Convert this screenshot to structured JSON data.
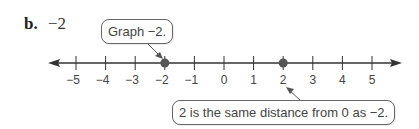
{
  "problem": {
    "label": "b.",
    "expression": "−2"
  },
  "callouts": {
    "top": "Graph −2.",
    "bottom": "2 is the same distance from 0 as −2."
  },
  "number_line": {
    "min": -5,
    "max": 5,
    "step": 1,
    "tick_labels": [
      "−5",
      "−4",
      "−3",
      "−2",
      "−1",
      "0",
      "1",
      "2",
      "3",
      "4",
      "5"
    ],
    "points": [
      -2,
      2
    ],
    "arrows": "both",
    "colors": {
      "line": "#333333",
      "point": "#555555"
    }
  }
}
